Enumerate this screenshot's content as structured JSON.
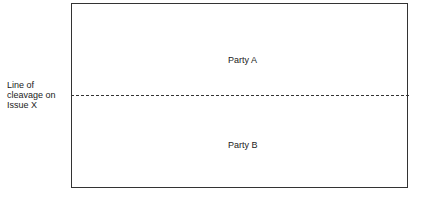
{
  "diagram": {
    "regions": [
      {
        "label": "Party A"
      },
      {
        "label": "Party B"
      }
    ],
    "divider": {
      "label_lines": [
        "Line of",
        "cleavage on",
        "Issue X"
      ],
      "style": "dashed"
    }
  }
}
